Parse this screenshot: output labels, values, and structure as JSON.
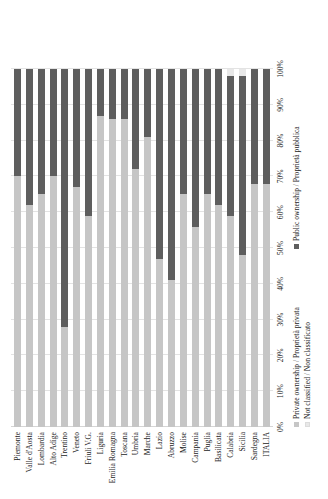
{
  "chart_data": {
    "type": "bar",
    "orientation": "horizontal-stacked",
    "title": "",
    "subtitle": "",
    "xlabel": "",
    "ylabel": "",
    "xlim": [
      0,
      100
    ],
    "grid": true,
    "legend_position": "bottom-left",
    "tick_labels": [
      "0%",
      "10%",
      "20%",
      "30%",
      "40%",
      "50%",
      "60%",
      "70%",
      "80%",
      "90%",
      "100%"
    ],
    "tick_values": [
      0,
      10,
      20,
      30,
      40,
      50,
      60,
      70,
      80,
      90,
      100
    ],
    "categories": [
      "Piemonte",
      "Valle d'Aosta",
      "Lombardia",
      "Alto Adige",
      "Trentino",
      "Veneto",
      "Friuli V.G.",
      "Liguria",
      "Emilia Romagna",
      "Toscana",
      "Umbria",
      "Marche",
      "Lazio",
      "Abruzzo",
      "Molise",
      "Campania",
      "Puglia",
      "Basilicata",
      "Calabria",
      "Sicilia",
      "Sardegna",
      "ITALIA"
    ],
    "series": [
      {
        "name": "Private ownership / Proprietà privata",
        "color": "#c6c6c6",
        "values": [
          70,
          62,
          65,
          70,
          28,
          67,
          59,
          87,
          86,
          86,
          72,
          81,
          47,
          41,
          65,
          56,
          65,
          62,
          59,
          48,
          68,
          68
        ]
      },
      {
        "name": "Public ownership / Proprietà pubblica",
        "color": "#5e5e5e",
        "values": [
          30,
          38,
          35,
          30,
          72,
          33,
          41,
          13,
          14,
          14,
          28,
          19,
          53,
          59,
          35,
          44,
          35,
          38,
          39,
          50,
          32,
          32
        ]
      },
      {
        "name": "Not classified / Non classificato",
        "color": "#e8e8e8",
        "values": [
          0,
          0,
          0,
          0,
          0,
          0,
          0,
          0,
          0,
          0,
          0,
          0,
          0,
          0,
          0,
          0,
          0,
          0,
          2,
          2,
          0,
          0
        ]
      }
    ]
  },
  "legend": {
    "private_label": "Private ownership / Proprietà privata",
    "public_label": "Public ownership / Proprietà pubblica",
    "not_classified_label": "Not classified / Non classificato"
  }
}
